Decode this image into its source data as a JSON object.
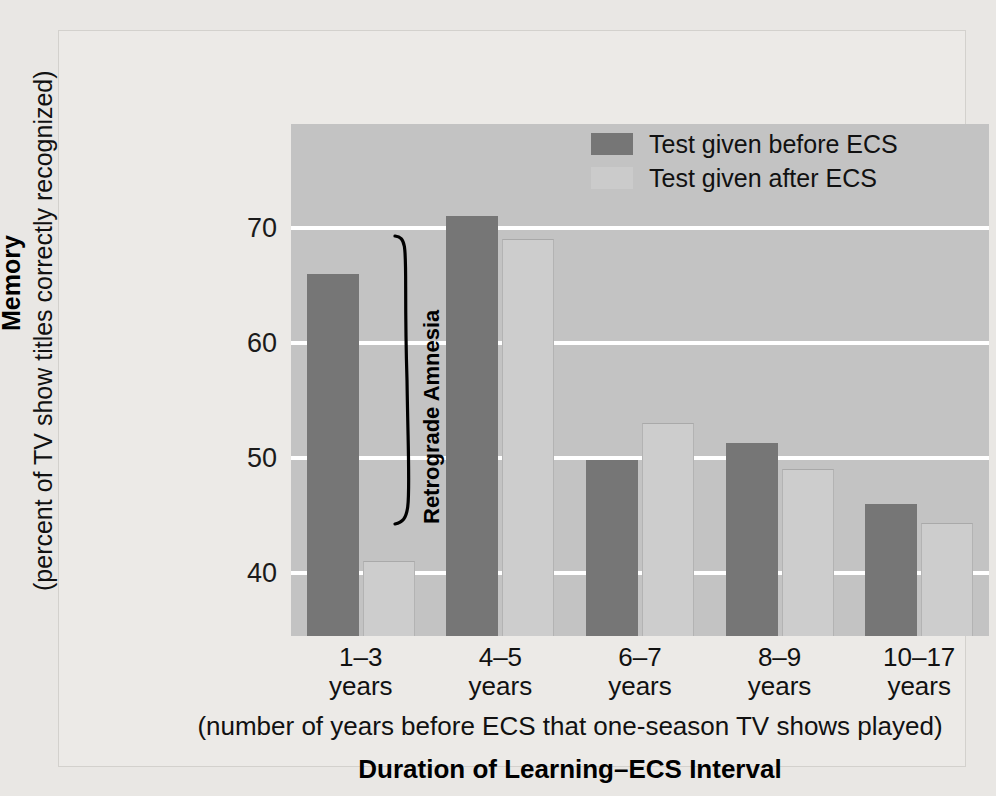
{
  "chart_data": {
    "type": "bar",
    "title": "",
    "xlabel": "Duration of Learning–ECS Interval",
    "xlabel_sub": "(number of years before ECS that one-season TV shows played)",
    "ylabel": "Memory",
    "ylabel_sub": "(percent of TV show titles correctly recognized)",
    "categories": [
      "1–3 years",
      "4–5 years",
      "6–7 years",
      "8–9 years",
      "10–17 years"
    ],
    "category_lines": [
      {
        "line1": "1–3",
        "line2": "years"
      },
      {
        "line1": "4–5",
        "line2": "years"
      },
      {
        "line1": "6–7",
        "line2": "years"
      },
      {
        "line1": "8–9",
        "line2": "years"
      },
      {
        "line1": "10–17",
        "line2": "years"
      }
    ],
    "series": [
      {
        "name": "Test given before ECS",
        "color": "#767676",
        "values": [
          66,
          71,
          49.8,
          51.3,
          46
        ]
      },
      {
        "name": "Test given after ECS",
        "color": "#cdcdcd",
        "values": [
          41,
          69,
          53,
          49,
          44.3
        ]
      }
    ],
    "yticks": [
      40,
      50,
      60,
      70
    ],
    "ytick_labels": [
      "40",
      "50",
      "60",
      "70"
    ],
    "ylim": [
      34.5,
      79
    ],
    "grid": true,
    "legend_position": "top-right",
    "annotations": [
      {
        "name": "retrograde-amnesia-bracket",
        "text": "Retrograde Amnesia"
      }
    ]
  },
  "legend": {
    "items": [
      {
        "label": "Test given before ECS",
        "swatch": "before"
      },
      {
        "label": "Test given after ECS",
        "swatch": "after"
      }
    ]
  },
  "colors": {
    "page_background": "#e9e7e4",
    "plot_background": "#c3c3c3",
    "gridline": "#ffffff",
    "bar_before": "#767676",
    "bar_after": "#cdcdcd",
    "text": "#111111"
  }
}
